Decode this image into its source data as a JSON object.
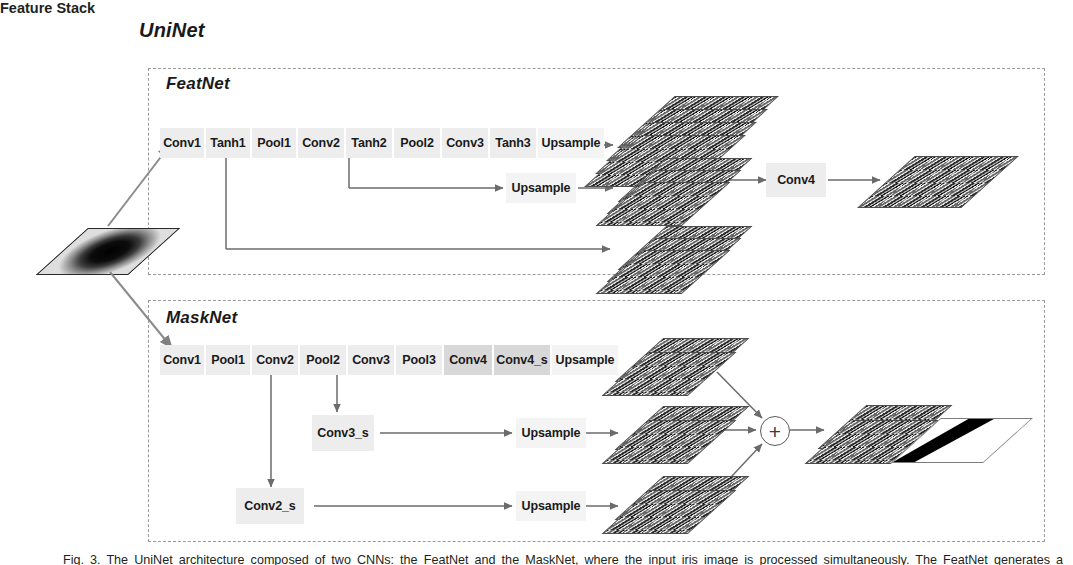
{
  "diagram": {
    "title": "UniNet",
    "feature_stack_label": "Feature Stack",
    "subnets": [
      {
        "name": "FeatNet"
      },
      {
        "name": "MaskNet"
      }
    ]
  },
  "featnet": {
    "title": "FeatNet",
    "main_blocks": [
      {
        "label": "Conv1",
        "shade": "light"
      },
      {
        "label": "Tanh1",
        "shade": "light"
      },
      {
        "label": "Pool1",
        "shade": "light"
      },
      {
        "label": "Conv2",
        "shade": "light"
      },
      {
        "label": "Tanh2",
        "shade": "light"
      },
      {
        "label": "Pool2",
        "shade": "light"
      },
      {
        "label": "Conv3",
        "shade": "light"
      },
      {
        "label": "Tanh3",
        "shade": "light"
      },
      {
        "label": "Upsample",
        "shade": "plain"
      }
    ],
    "branch_blocks": [
      {
        "label": "Upsample",
        "shade": "plain"
      }
    ],
    "conv4_label": "Conv4"
  },
  "masknet": {
    "title": "MaskNet",
    "main_blocks": [
      {
        "label": "Conv1",
        "shade": "light"
      },
      {
        "label": "Pool1",
        "shade": "light"
      },
      {
        "label": "Conv2",
        "shade": "light"
      },
      {
        "label": "Pool2",
        "shade": "light"
      },
      {
        "label": "Conv3",
        "shade": "light"
      },
      {
        "label": "Pool3",
        "shade": "light"
      },
      {
        "label": "Conv4",
        "shade": "dark"
      },
      {
        "label": "Conv4_s",
        "shade": "dark"
      },
      {
        "label": "Upsample",
        "shade": "plain"
      }
    ],
    "side_blocks": [
      {
        "label": "Conv3_s",
        "shade": "light"
      },
      {
        "label": "Conv2_s",
        "shade": "light"
      }
    ],
    "branch_upsample": [
      {
        "label": "Upsample",
        "shade": "plain"
      },
      {
        "label": "Upsample",
        "shade": "plain"
      }
    ],
    "merge_symbol": "+"
  },
  "colors": {
    "block_light": "#ededed",
    "block_dark": "#d8d8d8",
    "block_plain": "#f4f4f4",
    "dashed_border": "#9a9a9a",
    "arrow": "#6b6b6b",
    "text": "#231f20"
  },
  "caption": {
    "text": "Fig. 3. The UniNet architecture composed of two CNNs: the FeatNet and the MaskNet, where the input iris image is processed simultaneously. The FeatNet generates a normalized"
  }
}
